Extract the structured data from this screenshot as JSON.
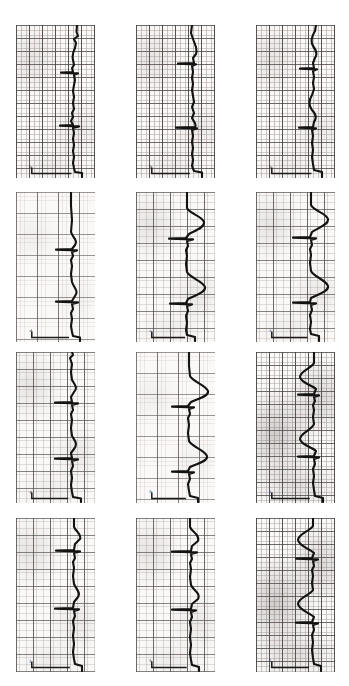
{
  "figure": {
    "kind": "ecg-strip-montage",
    "title": "",
    "background_color": "#ffffff",
    "paper_color": "#fbf9f7",
    "trace_color": "#121212",
    "grid_color": "#5a5050",
    "rows": 4,
    "columns": 3,
    "panel_count": 12,
    "orientation": "rotated-90-trace-runs-vertically"
  },
  "panels": [
    {
      "id": "panel-1",
      "row": 1,
      "col": 1,
      "label": "a",
      "x": 16,
      "y": 25,
      "w": 79,
      "h": 153,
      "grid_density": "fine",
      "shading": "normal",
      "baseline_x_pct": 60,
      "beats": 3,
      "calibration_mark": true,
      "trace": "M 61,0 L 60.5,7 L 62,11 L 58,14 L 60,18 L 59,23 C 57,27 56,31 57,35 L 58,40 L 56,43 L 57,47 L 45,47.6 L 62,48.4 L 58,50 L 59,55 L 58,60 L 57,66 L 58,72 L 57,78 L 58,84 L 56,88 L 57,92 L 55,96 L 57,100 L 44,100.6 L 63,101.4 L 57,103 L 58,108 L 57,114 L 58,120 L 57,126 L 58,132 L 57,138 L 58,143 L 59,147 L 66,148 L 66,152"
    },
    {
      "id": "panel-2",
      "row": 1,
      "col": 2,
      "label": "b",
      "x": 136,
      "y": 25,
      "w": 79,
      "h": 153,
      "grid_density": "fine",
      "shading": "normal",
      "baseline_x_pct": 58,
      "beats": 3,
      "calibration_mark": true,
      "trace": "M 56,0 L 55,8 L 57,14 C 59,20 62,24 60,29 L 57,33 L 58,38 L 42,38.6 L 60,39.4 L 56,41 L 57,47 L 56,53 L 57,59 L 56,65 L 57,71 L 58,77 L 56,82 L 58,88 L 56,93 C 58,97 61,99 59,102 L 40,102.6 L 61,103.4 L 56,105 L 57,111 L 56,117 L 57,123 L 56,129 L 57,135 L 56,141 L 58,146 L 66,147.5 L 66,152"
    },
    {
      "id": "panel-3",
      "row": 1,
      "col": 3,
      "label": "c",
      "x": 256,
      "y": 25,
      "w": 79,
      "h": 153,
      "grid_density": "fine",
      "shading": "normal",
      "baseline_x_pct": 60,
      "beats": 3,
      "calibration_mark": true,
      "trace": "M 60,0 L 59,6 C 56,11 54,16 57,21 C 60,25 62,29 59,33 L 57,38 L 58,43 L 44,43.6 L 61,44.4 L 57,46 L 58,52 L 57,58 L 58,64 L 56,70 C 53,75 52,80 56,85 C 60,89 61,93 58,97 L 57,102 L 43,102.6 L 60,103.4 L 56,105 L 57,111 L 56,118 L 57,125 L 56,132 L 57,139 L 58,145 L 66,147 L 66,152"
    },
    {
      "id": "panel-4",
      "row": 2,
      "col": 1,
      "label": "d",
      "x": 16,
      "y": 192,
      "w": 79,
      "h": 150,
      "grid_density": "coarse",
      "shading": "light",
      "baseline_x_pct": 57,
      "beats": 3,
      "calibration_mark": true,
      "trace": "M 55,0 L 55,14 L 56,28 L 55,40 C 57,46 62,48 59,53 L 56,57 L 40,57.6 L 61,58.4 L 56,60 L 57,64 L 55,68 L 56,74 L 55,82 L 56,90 C 58,96 63,99 59,104 L 56,109 L 40,109.6 L 62,110.4 L 56,112 L 57,117 L 55,121 L 56,127 L 55,134 L 56,140 L 57,144 L 64,145.5 L 64,149"
    },
    {
      "id": "panel-5",
      "row": 2,
      "col": 2,
      "label": "e",
      "x": 136,
      "y": 192,
      "w": 79,
      "h": 150,
      "grid_density": "medium",
      "shading": "normal",
      "baseline_x_pct": 52,
      "beats": 3,
      "calibration_mark": true,
      "trace": "M 51,0 L 51,16 C 54,22 66,24 68,30 C 69,36 58,39 53,42 L 50,46 L 33,46.6 L 57,47.4 L 51,49 L 52,54 L 50,58 L 51,64 L 50,72 L 51,80 C 54,86 67,89 69,95 C 70,101 57,104 52,107 L 50,111 L 34,111.6 L 56,112.4 L 51,114 L 52,119 L 50,124 L 51,131 L 50,138 L 51,143 L 59,145 L 59,149"
    },
    {
      "id": "panel-6",
      "row": 2,
      "col": 3,
      "label": "f",
      "x": 256,
      "y": 192,
      "w": 79,
      "h": 150,
      "grid_density": "medium",
      "shading": "normal",
      "baseline_x_pct": 55,
      "beats": 3,
      "calibration_mark": true,
      "trace": "M 55,0 L 55,13 C 58,19 70,21 72,27 C 73,33 61,36 56,40 L 54,45 L 37,45.6 L 60,46.4 L 55,48 L 56,53 L 54,57 L 55,63 L 54,71 L 55,79 C 58,85 70,88 72,94 C 73,100 60,103 55,106 L 54,110 L 37,110.6 L 60,111.4 L 55,113 L 56,118 L 54,123 L 55,130 L 54,137 L 55,142 L 63,144 L 63,149"
    },
    {
      "id": "panel-7",
      "row": 3,
      "col": 1,
      "label": "g",
      "x": 16,
      "y": 352,
      "w": 79,
      "h": 151,
      "grid_density": "medium",
      "shading": "normal",
      "baseline_x_pct": 56,
      "beats": 3,
      "calibration_mark": true,
      "trace": "M 56,0 L 57,3 L 54,6 L 56,12 L 55,20 L 56,28 C 59,33 62,36 58,40 L 55,45 L 56,50 L 39,50.6 L 62,51.4 L 56,53 L 57,58 L 55,62 L 56,68 L 55,76 L 56,84 C 59,89 62,92 58,97 L 55,101 L 56,106 L 39,106.6 L 62,107.4 L 56,109 L 57,114 L 55,119 L 56,126 L 55,133 L 56,140 L 57,145 L 65,146.5 L 65,150"
    },
    {
      "id": "panel-8",
      "row": 3,
      "col": 2,
      "label": "h",
      "x": 136,
      "y": 352,
      "w": 79,
      "h": 151,
      "grid_density": "coarse",
      "shading": "light",
      "baseline_x_pct": 53,
      "beats": 3,
      "calibration_mark": true,
      "trace": "M 53,0 L 53,14 L 54,24 C 57,30 70,33 72,39 C 73,45 60,47 55,50 L 52,54 L 36,54.6 L 58,55.4 L 53,57 L 54,62 L 52,66 L 53,73 L 52,81 L 53,89 C 56,95 69,98 71,104 C 72,110 59,112 54,115 L 52,119 L 36,119.6 L 58,120.4 L 53,122 L 54,127 L 52,132 L 53,139 L 54,144 L 62,146 L 62,150"
    },
    {
      "id": "panel-9",
      "row": 3,
      "col": 3,
      "label": "i",
      "x": 256,
      "y": 352,
      "w": 79,
      "h": 151,
      "grid_density": "fine",
      "shading": "heavy",
      "baseline_x_pct": 58,
      "beats": 3,
      "calibration_mark": true,
      "trace": "M 58,0 L 58,11 C 56,16 44,19 44,25 C 45,31 56,33 60,37 L 58,42 L 42,42.6 L 63,43.4 L 58,45 L 59,49 L 57,53 L 58,58 L 57,65 L 58,72 C 56,78 44,81 44,87 C 45,93 56,95 60,99 L 58,104 L 42,104.6 L 63,105.4 L 58,107 L 59,112 L 57,117 L 58,124 L 57,131 L 58,138 L 59,144 L 67,146 L 67,150"
    },
    {
      "id": "panel-10",
      "row": 4,
      "col": 1,
      "label": "j",
      "x": 16,
      "y": 518,
      "w": 79,
      "h": 154,
      "grid_density": "medium",
      "shading": "normal",
      "baseline_x_pct": 58,
      "beats": 3,
      "calibration_mark": true,
      "trace": "M 58,0 L 58,9 C 60,14 66,16 64,21 L 59,26 L 58,32 L 40,32.6 L 64,33.4 L 58,35 L 59,40 L 57,44 L 58,50 L 57,58 L 58,66 C 60,71 65,74 62,79 L 58,84 L 57,90 L 39,90.6 L 63,91.4 L 58,93 L 59,98 L 57,103 L 58,110 L 57,118 L 58,126 L 57,134 L 58,141 L 59,146 L 66,148 L 66,153"
    },
    {
      "id": "panel-11",
      "row": 4,
      "col": 2,
      "label": "k",
      "x": 136,
      "y": 518,
      "w": 79,
      "h": 154,
      "grid_density": "medium",
      "shading": "normal",
      "baseline_x_pct": 54,
      "beats": 3,
      "calibration_mark": true,
      "trace": "M 54,0 L 54,9 C 56,14 64,17 62,23 L 56,28 L 55,33 L 36,33.6 L 61,34.4 L 55,36 L 56,41 L 54,45 L 55,51 L 54,59 L 55,67 C 57,72 65,75 62,81 L 56,86 L 55,91 L 36,91.6 L 60,92.4 L 55,94 L 56,99 L 54,104 L 55,111 L 54,119 L 55,127 L 54,135 L 55,142 L 56,147 L 63,149 L 63,153"
    },
    {
      "id": "panel-12",
      "row": 4,
      "col": 3,
      "label": "l",
      "x": 256,
      "y": 518,
      "w": 79,
      "h": 154,
      "grid_density": "fine",
      "shading": "heavy",
      "baseline_x_pct": 57,
      "beats": 3,
      "calibration_mark": true,
      "trace": "M 57,0 L 57,8 C 54,13 42,16 42,22 C 43,28 54,31 58,35 L 56,40 L 40,40.6 L 62,41.4 L 57,43 L 58,48 L 56,52 L 57,58 L 56,65 L 57,72 C 54,77 42,80 42,86 C 43,92 54,95 58,99 L 56,104 L 40,104.6 L 62,105.4 L 57,107 L 58,112 L 56,117 L 57,124 L 56,132 L 57,140 L 58,146 L 65,148 L 65,153"
    }
  ]
}
